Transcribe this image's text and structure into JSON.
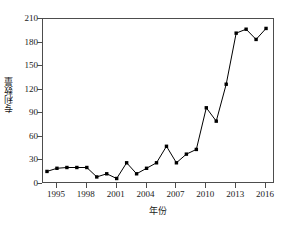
{
  "chart_data": {
    "type": "line",
    "title": "",
    "subtitle": "",
    "xlabel": "年份",
    "ylabel": "专利数量",
    "x": [
      1994,
      1995,
      1996,
      1997,
      1998,
      1999,
      2000,
      2001,
      2002,
      2003,
      2004,
      2005,
      2006,
      2007,
      2008,
      2009,
      2010,
      2011,
      2012,
      2013,
      2014,
      2015,
      2016
    ],
    "values": [
      16,
      20,
      21,
      21,
      21,
      9,
      13,
      7,
      27,
      13,
      20,
      27,
      48,
      27,
      38,
      44,
      97,
      80,
      127,
      192,
      197,
      184,
      198
    ],
    "series": [
      {
        "name": "专利数量",
        "values": [
          16,
          20,
          21,
          21,
          21,
          9,
          13,
          7,
          27,
          13,
          20,
          27,
          48,
          27,
          38,
          44,
          97,
          80,
          127,
          192,
          197,
          184,
          198
        ]
      }
    ],
    "xlim": [
      1993.6,
      2016.9
    ],
    "ylim": [
      0,
      210
    ],
    "ytick_labels": [
      "0",
      "30",
      "60",
      "90",
      "120",
      "150",
      "180",
      "210"
    ],
    "ytick_values": [
      0,
      30,
      60,
      90,
      120,
      150,
      180,
      210
    ],
    "xtick_labels": [
      "1995",
      "1998",
      "2001",
      "2004",
      "2007",
      "2010",
      "2013",
      "2016"
    ],
    "xtick_values": [
      1995,
      1998,
      2001,
      2004,
      2007,
      2010,
      2013,
      2016
    ],
    "grid": false,
    "legend": "none",
    "marker": "filled-square",
    "line_color": "#000000",
    "marker_color": "#000000",
    "axis_color": "#4d4d4d",
    "background_color": "#ffffff"
  }
}
